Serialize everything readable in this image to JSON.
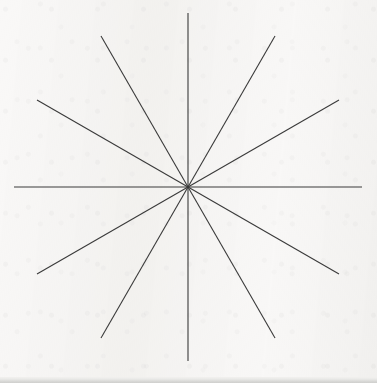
{
  "figure": {
    "background_color": "#f2f1ef",
    "line_color": "#3a3a3a",
    "line_width": 1.1,
    "bottom_band_color": "#cfcfcd",
    "canvas": {
      "width": 377,
      "height": 383
    }
  },
  "chart_data": {
    "type": "line",
    "xlabel": "",
    "ylabel": "",
    "grid": false,
    "legend": "none",
    "center": {
      "x": 188,
      "y": 187
    },
    "radius": 174,
    "ray_count": 12,
    "line_count": 6,
    "angular_spacing_degrees": 30,
    "lines": [
      {
        "name": "horizontal-line",
        "angle_degrees": 0,
        "x1": 14,
        "y1": 187,
        "x2": 362,
        "y2": 187
      },
      {
        "name": "shallow-diagonal-up-right",
        "angle_degrees": 30,
        "x1": 37,
        "y1": 274,
        "x2": 339,
        "y2": 100
      },
      {
        "name": "steep-diagonal-up-right",
        "angle_degrees": 60,
        "x1": 101,
        "y1": 338,
        "x2": 275,
        "y2": 36
      },
      {
        "name": "vertical-line",
        "angle_degrees": 90,
        "x1": 188,
        "y1": 361,
        "x2": 188,
        "y2": 13
      },
      {
        "name": "steep-diagonal-up-left",
        "angle_degrees": 120,
        "x1": 275,
        "y1": 338,
        "x2": 101,
        "y2": 36
      },
      {
        "name": "shallow-diagonal-up-left",
        "angle_degrees": 150,
        "x1": 339,
        "y1": 274,
        "x2": 37,
        "y2": 100
      }
    ],
    "ray_endpoints": [
      {
        "label": "east",
        "angle_degrees": 0,
        "x": 362,
        "y": 187
      },
      {
        "label": "east-northeast",
        "angle_degrees": 30,
        "x": 339,
        "y": 100
      },
      {
        "label": "north-northeast",
        "angle_degrees": 60,
        "x": 275,
        "y": 36
      },
      {
        "label": "north",
        "angle_degrees": 90,
        "x": 188,
        "y": 13
      },
      {
        "label": "north-northwest",
        "angle_degrees": 120,
        "x": 101,
        "y": 36
      },
      {
        "label": "west-northwest",
        "angle_degrees": 150,
        "x": 37,
        "y": 100
      },
      {
        "label": "west",
        "angle_degrees": 180,
        "x": 14,
        "y": 187
      },
      {
        "label": "west-southwest",
        "angle_degrees": 210,
        "x": 37,
        "y": 274
      },
      {
        "label": "south-southwest",
        "angle_degrees": 240,
        "x": 101,
        "y": 338
      },
      {
        "label": "south",
        "angle_degrees": 270,
        "x": 188,
        "y": 361
      },
      {
        "label": "south-southeast",
        "angle_degrees": 300,
        "x": 275,
        "y": 338
      },
      {
        "label": "east-southeast",
        "angle_degrees": 330,
        "x": 339,
        "y": 274
      }
    ]
  }
}
